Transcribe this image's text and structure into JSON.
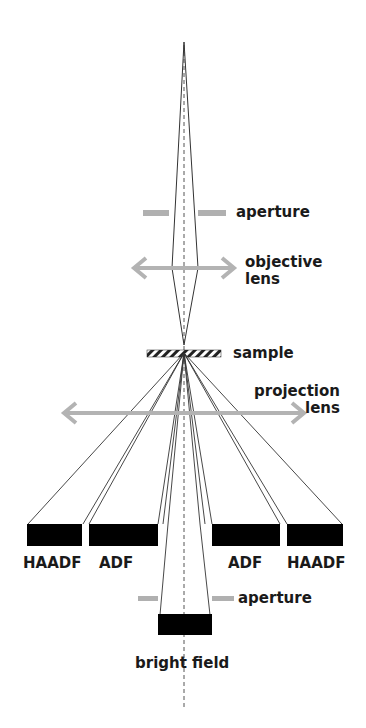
{
  "labels": {
    "aperture_top": "aperture",
    "objective_lens_line1": "objective",
    "objective_lens_line2": "lens",
    "sample": "sample",
    "projection_lens_line1": "projection",
    "projection_lens_line2": "lens",
    "haadf_left": "HAADF",
    "adf_left": "ADF",
    "adf_right": "ADF",
    "haadf_right": "HAADF",
    "aperture_bottom": "aperture",
    "bright_field": "bright field"
  },
  "colors": {
    "ray": "#333333",
    "lens_arrow": "#b3b3b3",
    "aperture": "#b0b0b0",
    "detector": "#000000",
    "axis": "#555555"
  }
}
